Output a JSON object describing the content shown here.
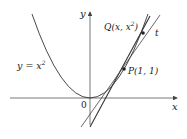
{
  "diagram": {
    "curve_label": "y = x",
    "curve_exponent": "2",
    "axis_x_label": "x",
    "axis_y_label": "y",
    "origin_label": "0",
    "point_p_label": "P(1, 1)",
    "point_q_label_prefix": "Q(x, x",
    "point_q_exponent": "2",
    "point_q_label_suffix": ")",
    "tangent_label": "t",
    "colors": {
      "stroke": "#333333",
      "axis": "#555555",
      "background": "#ffffff"
    }
  }
}
